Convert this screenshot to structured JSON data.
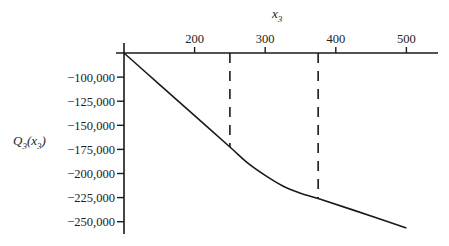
{
  "chart_data": {
    "type": "line",
    "title": "",
    "xlabel": "x_3",
    "ylabel": "Q_3(x_3)",
    "x_axis_position": "top",
    "xlim": [
      100,
      560
    ],
    "ylim": [
      -265000,
      -75000
    ],
    "x_ticks": [
      200,
      300,
      400,
      500
    ],
    "x_tick_labels": [
      "200",
      "300",
      "400",
      "500"
    ],
    "y_ticks": [
      -100000,
      -125000,
      -150000,
      -175000,
      -200000,
      -225000,
      -250000
    ],
    "y_tick_labels": [
      "−100,000",
      "−125,000",
      "−150,000",
      "−175,000",
      "−200,000",
      "−225,000",
      "−250,000"
    ],
    "grid": false,
    "legend": null,
    "series": [
      {
        "name": "Q_3(x_3)",
        "style": "solid",
        "color": "#1a1a1a",
        "x": [
          100,
          150,
          200,
          250,
          275,
          300,
          325,
          350,
          375,
          425,
          500
        ],
        "y": [
          -75000,
          -107500,
          -140000,
          -172500,
          -189000,
          -202000,
          -213000,
          -220500,
          -226000,
          -238000,
          -256500
        ]
      }
    ],
    "annotations": [
      {
        "type": "vertical-dashed-line",
        "x": 250,
        "y_end": -172500
      },
      {
        "type": "vertical-dashed-line",
        "x": 375,
        "y_end": -226000
      }
    ]
  },
  "labels": {
    "x_axis_title": "x",
    "x_axis_sub": "3",
    "y_axis_title_main": "Q",
    "y_axis_title_sub": "3",
    "y_axis_title_arg": "(x",
    "y_axis_title_arg_sub": "3",
    "y_axis_title_close": ")"
  }
}
